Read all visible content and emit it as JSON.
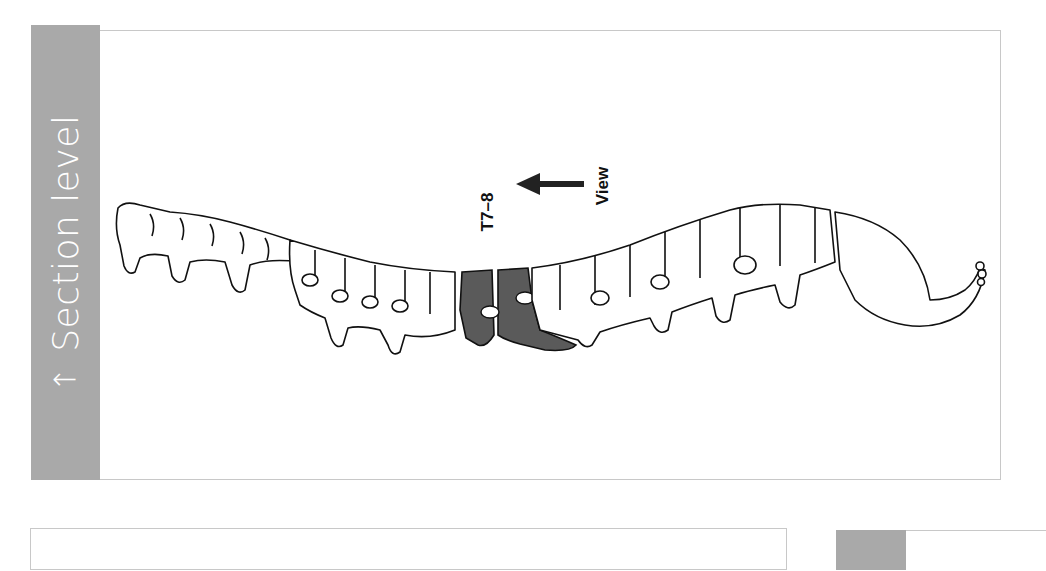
{
  "section": {
    "label": "Section level",
    "arrow_icon": "up-arrow-icon"
  },
  "figure": {
    "level_label": "T7–8",
    "view_label": "View",
    "view_arrow_icon": "left-arrow-icon",
    "highlight_color": "#5a5a5a",
    "tab_color": "#a9a9a9"
  }
}
